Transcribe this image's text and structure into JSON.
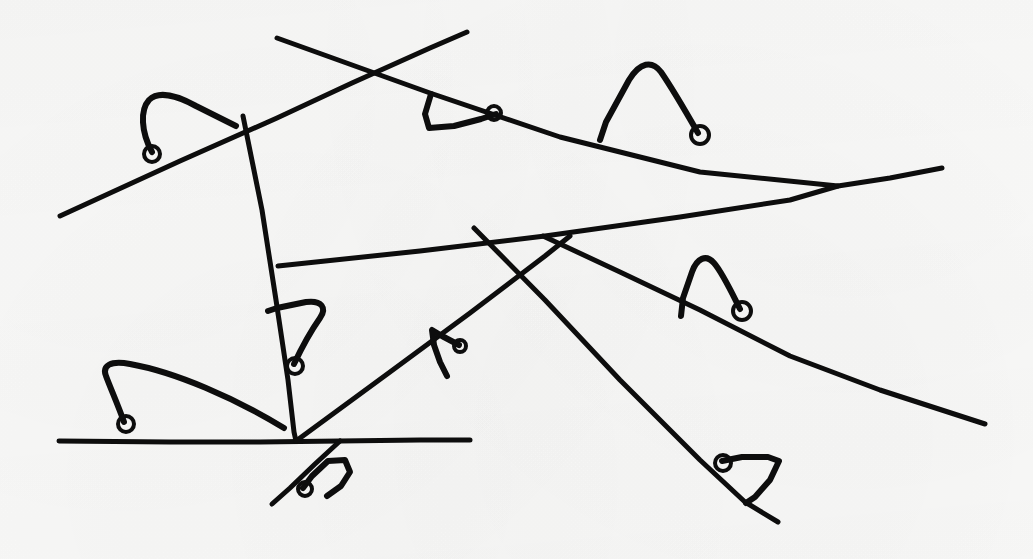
{
  "figure": {
    "medium": "ink on paper (scanned)",
    "canvas": {
      "width": 1033,
      "height": 559
    },
    "background_color": "#fbfbfa",
    "ink_color": "#0d0d0d"
  },
  "lines": [
    {
      "id": "line-upper-left-ridge",
      "label": "Upper left ascending line",
      "stroke_width": 5,
      "path": "M 60 216 L 180 161 L 277 118 L 352 83 L 430 48 L 467 32"
    },
    {
      "id": "line-top-long-right",
      "label": "Long line from top vertex to far right",
      "stroke_width": 5,
      "path": "M 277 38 L 430 93 L 560 137 L 700 172 L 838 186 L 890 178 L 942 168"
    },
    {
      "id": "line-mid-wedge-upper",
      "label": "Mid horizontal wedge line to right apex",
      "stroke_width": 5,
      "path": "M 278 266 L 420 251 L 545 236 L 680 217 L 790 200 L 838 186"
    },
    {
      "id": "line-vertical-drop",
      "label": "Near-vertical line from top ridge down to hub",
      "stroke_width": 5,
      "path": "M 243 116 L 262 210 L 276 300 L 288 380 L 294 432 L 296 441"
    },
    {
      "id": "line-bottom-horizontal",
      "label": "Bottom horizontal base line",
      "stroke_width": 5,
      "path": "M 59 441 L 170 442 L 260 442 L 340 441 L 420 440 L 470 440"
    },
    {
      "id": "line-hub-to-upper-right",
      "label": "Line from hub rising to upper right crossing point",
      "stroke_width": 5,
      "path": "M 296 441 L 390 372 L 470 313 L 545 256 L 570 236"
    },
    {
      "id": "line-right-descending-long",
      "label": "Long descending line to far right edge",
      "stroke_width": 5,
      "path": "M 543 236 L 620 272 L 700 310 L 790 356 L 880 390 L 985 424"
    },
    {
      "id": "line-lower-right-diagonal",
      "label": "Diagonal from upper-mid down to lower right",
      "stroke_width": 5,
      "path": "M 474 228 L 545 300 L 620 380 L 700 460 L 745 502 L 778 522"
    },
    {
      "id": "line-hub-to-lower-left",
      "label": "Short diagonal from hub down to lower left tail",
      "stroke_width": 5,
      "path": "M 340 441 L 315 464 L 290 488 L 272 504"
    }
  ],
  "angle_markers": [
    {
      "id": "marker-upper-left",
      "label": "Angle marker on upper-left ascending line",
      "stroke_width": 6,
      "dot_radius": 8,
      "dot_center": [
        152,
        154
      ],
      "path": "M 152 152 C 141 132 140 110 149 100 C 158 91 176 95 196 106 L 236 126"
    },
    {
      "id": "marker-top-center",
      "label": "Angle marker below top long line, center",
      "stroke_width": 6,
      "dot_radius": 7,
      "dot_center": [
        494,
        113
      ],
      "path": "M 431 94 L 425 114 L 429 128 L 454 126 L 481 119 L 496 114"
    },
    {
      "id": "marker-top-right",
      "label": "Angle marker on top long line, right side",
      "stroke_width": 6,
      "dot_radius": 9,
      "dot_center": [
        700,
        135
      ],
      "path": "M 698 133 C 686 112 672 88 661 72 C 652 60 640 62 629 80 L 606 122 L 600 140"
    },
    {
      "id": "marker-mid-right",
      "label": "Angle marker on mid-right descending line",
      "stroke_width": 6,
      "dot_radius": 9,
      "dot_center": [
        742,
        311
      ],
      "path": "M 740 309 C 730 289 722 272 714 263 C 706 254 697 258 692 272 L 683 298 L 681 316"
    },
    {
      "id": "marker-hub-upper",
      "label": "Angle marker above hub on vertical drop line",
      "stroke_width": 6,
      "dot_radius": 8,
      "dot_center": [
        295,
        366
      ],
      "path": "M 294 364 C 302 347 313 328 320 318 C 327 308 322 300 306 302 L 277 308 L 268 311"
    },
    {
      "id": "marker-bottom-left",
      "label": "Angle marker on bottom horizontal base line",
      "stroke_width": 6,
      "dot_radius": 8,
      "dot_center": [
        126,
        424
      ],
      "path": "M 124 422 C 118 405 110 387 106 376 C 102 366 110 360 130 364 C 175 372 235 398 284 428"
    },
    {
      "id": "marker-center-small",
      "label": "Small angle marker at mid-left of rising hub line",
      "stroke_width": 6,
      "dot_radius": 6,
      "dot_center": [
        460,
        346
      ],
      "path": "M 459 345 L 442 336 L 432 330 L 434 345 L 440 362 L 447 376"
    },
    {
      "id": "marker-bottom-center",
      "label": "Angle marker on lower-left tail diagonal",
      "stroke_width": 6,
      "dot_radius": 7,
      "dot_center": [
        305,
        489
      ],
      "path": "M 303 488 L 312 476 L 328 461 L 345 460 L 350 472 L 341 486 L 327 496"
    },
    {
      "id": "marker-lower-right",
      "label": "Angle marker on lower-right diagonal",
      "stroke_width": 6,
      "dot_radius": 8,
      "dot_center": [
        723,
        463
      ],
      "path": "M 722 461 L 742 457 L 768 457 L 779 461 L 770 480 L 755 497 L 746 503"
    }
  ],
  "counts": {
    "lines": 9,
    "angle_markers": 9
  }
}
